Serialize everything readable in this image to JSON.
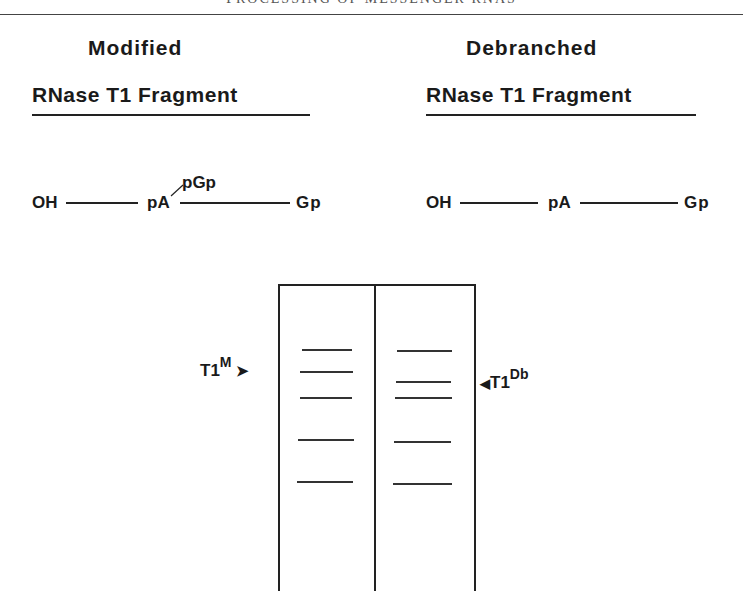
{
  "running_head": "PROCESSING OF MESSENGER RNAS",
  "panels": [
    {
      "title": "Modified",
      "subtitle": "RNase T1 Fragment",
      "sequence": {
        "left": "OH",
        "middle": "pA",
        "branch": "pGp",
        "right": "Gp"
      }
    },
    {
      "title": "Debranched",
      "subtitle": "RNase T1 Fragment",
      "sequence": {
        "left": "OH",
        "middle": "pA",
        "right": "Gp"
      }
    }
  ],
  "gel": {
    "lanes": [
      {
        "name": "modified",
        "bands_y": [
          349,
          371,
          397,
          439,
          481
        ]
      },
      {
        "name": "debranched",
        "bands_y": [
          350,
          381,
          397,
          441,
          483
        ]
      }
    ],
    "markers": [
      {
        "label": "T1",
        "superscript": "M",
        "arrow": "➤",
        "lane": "left",
        "y": 371
      },
      {
        "label": "T1",
        "superscript": "Db",
        "arrow": "◀",
        "lane": "right",
        "y": 381
      }
    ]
  }
}
